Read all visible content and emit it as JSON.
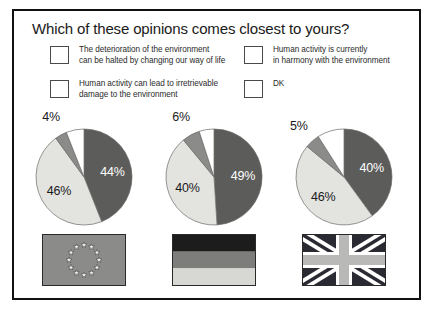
{
  "title": "Which of these opinions comes closest to yours?",
  "colors": {
    "light_gray": "#e3e3e0",
    "medium_gray": "#8b8b89",
    "dark_gray": "#5c5c5a",
    "white": "#ffffff",
    "border": "#111111",
    "text": "#1a1a1a"
  },
  "legend": {
    "items": [
      {
        "key": "halted",
        "label": "The deterioration of the environment\ncan be halted by changing our way of life",
        "color": "#e3e3e0",
        "swatch_name": "legend-swatch-light-gray"
      },
      {
        "key": "harmony",
        "label": "Human activity is currently\nin harmony with the environment",
        "color": "#8b8b89",
        "swatch_name": "legend-swatch-medium-gray"
      },
      {
        "key": "damage",
        "label": "Human activity can lead to irretrievable\ndamage to the environment",
        "color": "#5c5c5a",
        "swatch_name": "legend-swatch-dark-gray"
      },
      {
        "key": "dk",
        "label": "DK",
        "color": "#ffffff",
        "swatch_name": "legend-swatch-white"
      }
    ]
  },
  "chart_data": {
    "type": "pie",
    "title": "Which of these opinions comes closest to yours?",
    "legend_position": "top",
    "categories": [
      "The deterioration of the environment can be halted by changing our way of life",
      "Human activity is currently in harmony with the environment",
      "Human activity can lead to irretrievable damage to the environment",
      "DK"
    ],
    "category_colors": [
      "#e3e3e0",
      "#8b8b89",
      "#5c5c5a",
      "#ffffff"
    ],
    "units": "percent",
    "charts": [
      {
        "name": "european-union",
        "flag": "eu-flag",
        "slices": [
          {
            "category": "damage",
            "value": 44,
            "label": "44%",
            "color": "#5c5c5a",
            "label_shown": true,
            "label_placement": "inside"
          },
          {
            "category": "halted",
            "value": 46,
            "label": "46%",
            "color": "#e3e3e0",
            "label_shown": true,
            "label_placement": "inside"
          },
          {
            "category": "harmony",
            "value": 4,
            "label": "4%",
            "color": "#8b8b89",
            "label_shown": true,
            "label_placement": "outside"
          },
          {
            "category": "dk",
            "value": 6,
            "label": "6%",
            "color": "#ffffff",
            "label_shown": false,
            "label_placement": "none"
          }
        ]
      },
      {
        "name": "germany",
        "flag": "germany-flag",
        "slices": [
          {
            "category": "damage",
            "value": 49,
            "label": "49%",
            "color": "#5c5c5a",
            "label_shown": true,
            "label_placement": "inside"
          },
          {
            "category": "halted",
            "value": 40,
            "label": "40%",
            "color": "#e3e3e0",
            "label_shown": true,
            "label_placement": "inside"
          },
          {
            "category": "harmony",
            "value": 6,
            "label": "6%",
            "color": "#8b8b89",
            "label_shown": true,
            "label_placement": "outside"
          },
          {
            "category": "dk",
            "value": 5,
            "label": "5%",
            "color": "#ffffff",
            "label_shown": false,
            "label_placement": "none"
          }
        ]
      },
      {
        "name": "united-kingdom",
        "flag": "uk-flag",
        "slices": [
          {
            "category": "damage",
            "value": 40,
            "label": "40%",
            "color": "#5c5c5a",
            "label_shown": true,
            "label_placement": "inside"
          },
          {
            "category": "halted",
            "value": 46,
            "label": "46%",
            "color": "#e3e3e0",
            "label_shown": true,
            "label_placement": "inside"
          },
          {
            "category": "harmony",
            "value": 5,
            "label": "5%",
            "color": "#8b8b89",
            "label_shown": true,
            "label_placement": "outside"
          },
          {
            "category": "dk",
            "value": 9,
            "label": "9%",
            "color": "#ffffff",
            "label_shown": false,
            "label_placement": "none"
          }
        ]
      }
    ]
  },
  "flags": [
    {
      "name": "eu-flag",
      "star_count": 12,
      "field_color": "#8b8b89",
      "star_color": "#f2f2f0"
    },
    {
      "name": "germany-flag",
      "bands": [
        "#1c1c1c",
        "#7d7d7b",
        "#d7d7d4"
      ]
    },
    {
      "name": "uk-flag",
      "field_color": "#2a2a33",
      "cross_color": "#b9b9b7",
      "diagonal_color": "#ffffff"
    }
  ]
}
